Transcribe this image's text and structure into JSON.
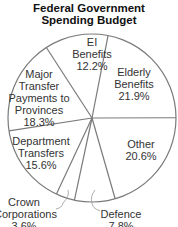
{
  "chart_data": {
    "type": "pie",
    "title": "Federal Government Spending Budget",
    "title_lines": [
      "Federal Government",
      "Spending Budget"
    ],
    "start_angle_deg": -79,
    "direction": "clockwise",
    "slices": [
      {
        "label": "Elderly Benefits",
        "lines": [
          "Elderly",
          "Benefits",
          "21.9%"
        ],
        "value": 21.9,
        "pct_label": "21.9%"
      },
      {
        "label": "Other",
        "lines": [
          "Other",
          "20.6%"
        ],
        "value": 20.6,
        "pct_label": "20.6%"
      },
      {
        "label": "Defence",
        "lines": [
          "Defence",
          "7.8%"
        ],
        "value": 7.8,
        "pct_label": "7.8%"
      },
      {
        "label": "Crown Corporations",
        "lines": [
          "Crown",
          "Corporations",
          "3.6%"
        ],
        "value": 3.6,
        "pct_label": "3.6%"
      },
      {
        "label": "Department Transfers",
        "lines": [
          "Department",
          "Transfers",
          "15.6%"
        ],
        "value": 15.6,
        "pct_label": "15.6%"
      },
      {
        "label": "Major Transfer Payments to Provinces",
        "lines": [
          "Major",
          "Transfer",
          "Payments to",
          "Provinces",
          "18.3%"
        ],
        "value": 18.3,
        "pct_label": "18.3%"
      },
      {
        "label": "EI Benefits",
        "lines": [
          "EI",
          "Benefits",
          "12.2%"
        ],
        "value": 12.2,
        "pct_label": "12.2%"
      }
    ],
    "colors": {
      "fill": "#ffffff",
      "stroke": "#7a7a7a",
      "text": "#333333"
    },
    "legend": "none",
    "grid": false
  }
}
